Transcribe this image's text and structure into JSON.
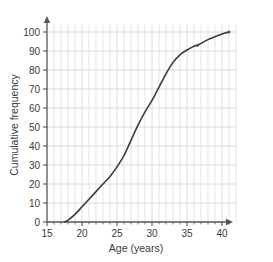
{
  "chart_data": {
    "type": "line",
    "title": "",
    "subtitle": "",
    "xlabel": "Age (years)",
    "ylabel": "Cumulative frequency",
    "xlim": [
      15,
      42
    ],
    "ylim": [
      0,
      105
    ],
    "xticks": [
      15,
      20,
      25,
      30,
      35,
      40
    ],
    "yticks": [
      0,
      10,
      20,
      30,
      40,
      50,
      60,
      70,
      80,
      90,
      100
    ],
    "xtick_labels": [
      "15",
      "20",
      "25",
      "30",
      "35",
      "40"
    ],
    "ytick_labels": [
      "0",
      "10",
      "20",
      "30",
      "40",
      "50",
      "60",
      "70",
      "80",
      "90",
      "100"
    ],
    "x_minor_step": 1,
    "y_minor_step": 10,
    "grid": true,
    "grid_color": "#d8d8dd",
    "legend": null,
    "legend_position": "none",
    "line_color": "#3b3b3b",
    "line_width": 1.6,
    "marker_color": "#555555",
    "axis_color": "#555555",
    "series": [
      {
        "name": "Cumulative frequency",
        "x": [
          17.5,
          18,
          19,
          20,
          21,
          22,
          23,
          24,
          25,
          26,
          27,
          28,
          29,
          30,
          31,
          32,
          33,
          34,
          35,
          36,
          36.5,
          37,
          38,
          39,
          40,
          41
        ],
        "values": [
          0,
          1,
          4,
          8,
          12,
          16,
          20,
          24,
          29,
          35,
          43,
          51,
          58,
          64,
          71,
          78,
          84,
          88,
          90.5,
          92.5,
          93,
          94,
          96,
          97.5,
          99,
          100
        ]
      }
    ],
    "markers": [
      {
        "x": 36.5,
        "y": 93
      },
      {
        "x": 41,
        "y": 100
      }
    ]
  },
  "axes": {
    "x_axis_name": "Age (years)",
    "y_axis_name": "Cumulative frequency",
    "x_arrow": true,
    "y_arrow": true
  }
}
